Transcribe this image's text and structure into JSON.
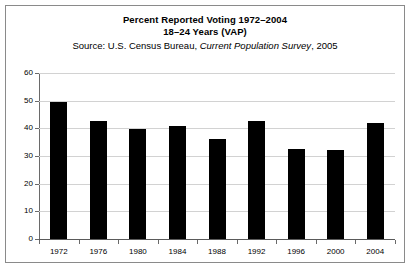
{
  "chart_data": {
    "type": "bar",
    "title": "Percent Reported Voting 1972–2004",
    "subtitle": "18–24 Years (VAP)",
    "source_prefix": "Source: U.S. Census Bureau, ",
    "source_italic": "Current Population Survey",
    "source_suffix": ", 2005",
    "categories": [
      "1972",
      "1976",
      "1980",
      "1984",
      "1988",
      "1992",
      "1996",
      "2000",
      "2004"
    ],
    "values": [
      49.6,
      42.5,
      39.9,
      40.8,
      36.2,
      42.8,
      32.4,
      32.3,
      41.9
    ],
    "xlabel": "",
    "ylabel": "",
    "ylim": [
      0,
      60
    ],
    "ytick_values": [
      0,
      10,
      20,
      30,
      40,
      50,
      60
    ],
    "ytick_labels": [
      "0",
      "10",
      "20",
      "30",
      "40",
      "50",
      "60"
    ],
    "grid": true,
    "legend": false,
    "bar_color": "#000000",
    "grid_color": "#d2d2d2",
    "axis_color": "#6a6a6a",
    "frame_color": "#8a8a8a",
    "background": "#ffffff"
  }
}
